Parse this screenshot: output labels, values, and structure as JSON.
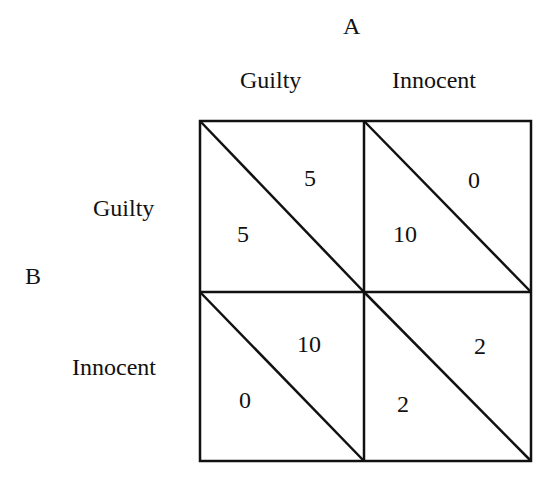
{
  "players": {
    "column_player": "A",
    "row_player": "B"
  },
  "column_strategies": [
    "Guilty",
    "Innocent"
  ],
  "row_strategies": [
    "Guilty",
    "Innocent"
  ],
  "payoffs": {
    "gg": {
      "a": "5",
      "b": "5"
    },
    "gi": {
      "a": "0",
      "b": "10"
    },
    "ig": {
      "a": "10",
      "b": "0"
    },
    "ii": {
      "a": "2",
      "b": "2"
    }
  },
  "payoff_note": "Upper-right triangle of each cell = A's payoff, lower-left = B's payoff"
}
